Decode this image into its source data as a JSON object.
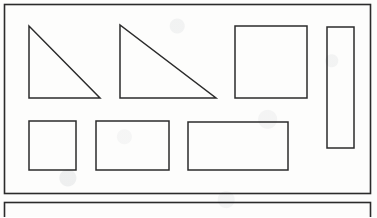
{
  "document": {
    "kind": "geometry-shapes-worksheet-scan",
    "width": 377,
    "height": 217,
    "background_color": "#fdfdfc",
    "ink_color": "#2b2b2b",
    "ink_color_light": "#3d3d3d",
    "panels": [
      {
        "name": "main-shapes-panel",
        "x": 4.5,
        "y": 4.5,
        "width": 366,
        "height": 189,
        "stroke_width": 1.6
      },
      {
        "name": "lower-empty-panel",
        "x": 4.5,
        "y": 202.5,
        "width": 366,
        "height": 30,
        "stroke_width": 1.6
      }
    ]
  },
  "chart_data": {
    "type": "diagram",
    "title": "",
    "shapes": [
      {
        "id": "right-triangle-1",
        "label": "Right triangle (small)",
        "type": "polygon",
        "points": "29,26 29,98 100,98",
        "vertices": [
          [
            29,
            26
          ],
          [
            29,
            98
          ],
          [
            100,
            98
          ]
        ],
        "legs": {
          "vertical": 72,
          "horizontal": 71
        },
        "stroke_width": 1.5,
        "row": 1,
        "column": 1
      },
      {
        "id": "right-triangle-2",
        "label": "Right triangle (large)",
        "type": "polygon",
        "points": "120,25 120,98 216,98",
        "vertices": [
          [
            120,
            25
          ],
          [
            120,
            98
          ],
          [
            216,
            98
          ]
        ],
        "legs": {
          "vertical": 73,
          "horizontal": 96
        },
        "stroke_width": 1.5,
        "row": 1,
        "column": 2
      },
      {
        "id": "square-large",
        "label": "Square",
        "type": "rect",
        "x": 235,
        "y": 26,
        "width": 72,
        "height": 72,
        "stroke_width": 1.5,
        "row": 1,
        "column": 3
      },
      {
        "id": "tall-narrow-rectangle",
        "label": "Tall narrow rectangle",
        "type": "rect",
        "x": 327,
        "y": 27,
        "width": 27,
        "height": 121,
        "stroke_width": 1.5,
        "row": 1,
        "column": 4
      },
      {
        "id": "square-small",
        "label": "Small square",
        "type": "rect",
        "x": 29,
        "y": 121,
        "width": 47,
        "height": 49,
        "stroke_width": 1.5,
        "row": 2,
        "column": 1
      },
      {
        "id": "rectangle-medium",
        "label": "Medium rectangle",
        "type": "rect",
        "x": 96,
        "y": 121,
        "width": 73,
        "height": 49,
        "stroke_width": 1.5,
        "row": 2,
        "column": 2
      },
      {
        "id": "rectangle-wide",
        "label": "Wide rectangle",
        "type": "rect",
        "x": 188,
        "y": 122,
        "width": 100,
        "height": 48,
        "stroke_width": 1.5,
        "row": 2,
        "column": 3
      }
    ],
    "counts": {
      "triangles": 2,
      "rectangles": 5,
      "total": 7
    },
    "grid": "on",
    "legend": "none",
    "annotations": []
  }
}
